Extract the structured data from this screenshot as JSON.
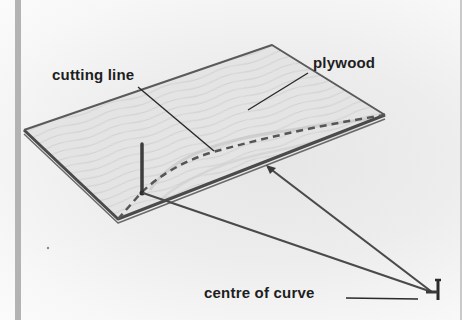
{
  "diagram": {
    "labels": {
      "cutting_line": "cutting line",
      "plywood": "plywood",
      "centre_of_curve": "centre of curve"
    },
    "parts": [
      {
        "name": "plywood-sheet",
        "description": "flat sheet of plywood with wood grain"
      },
      {
        "name": "cutting-line",
        "description": "dashed curved line across the sheet"
      },
      {
        "name": "nail-at-edge",
        "description": "upright nail at the edge of the sheet"
      },
      {
        "name": "string-lines",
        "description": "two taut strings meeting at the centre of curve"
      },
      {
        "name": "centre-nail",
        "description": "nail marking the centre of curve"
      }
    ],
    "colors": {
      "ink": "#3a3a3a",
      "text": "#1e1e1e",
      "board_fill": "#e2e2e2",
      "background": "#eeeeee"
    }
  }
}
